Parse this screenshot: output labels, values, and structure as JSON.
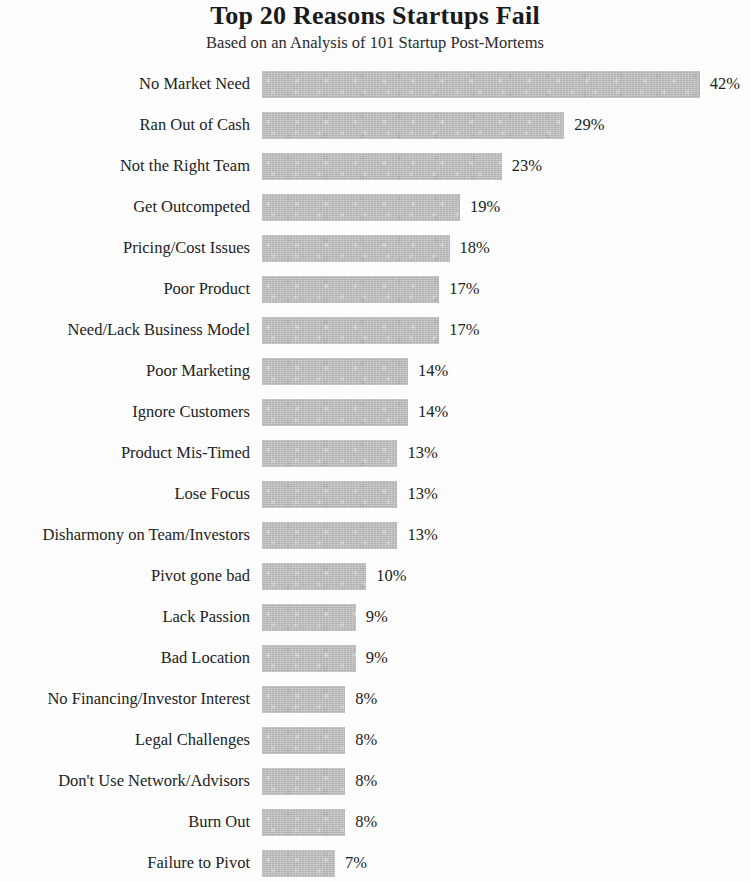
{
  "chart_data": {
    "type": "bar",
    "orientation": "horizontal",
    "title": "Top 20 Reasons Startups Fail",
    "subtitle": "Based on an Analysis of 101 Startup Post-Mortems",
    "xlabel": "",
    "ylabel": "",
    "xlim": [
      0,
      42
    ],
    "grid": false,
    "legend": null,
    "value_suffix": "%",
    "bar_color": "#bebebe",
    "text_color": "#222222",
    "background_color": "#fdfdfd",
    "categories": [
      "No Market Need",
      "Ran Out of Cash",
      "Not the Right Team",
      "Get Outcompeted",
      "Pricing/Cost Issues",
      "Poor Product",
      "Need/Lack Business Model",
      "Poor Marketing",
      "Ignore Customers",
      "Product Mis-Timed",
      "Lose Focus",
      "Disharmony on Team/Investors",
      "Pivot gone bad",
      "Lack Passion",
      "Bad Location",
      "No Financing/Investor Interest",
      "Legal Challenges",
      "Don't Use Network/Advisors",
      "Burn Out",
      "Failure to Pivot"
    ],
    "values": [
      42,
      29,
      23,
      19,
      18,
      17,
      17,
      14,
      14,
      13,
      13,
      13,
      10,
      9,
      9,
      8,
      8,
      8,
      8,
      7
    ],
    "value_labels": [
      "42%",
      "29%",
      "23%",
      "19%",
      "18%",
      "17%",
      "17%",
      "14%",
      "14%",
      "13%",
      "13%",
      "13%",
      "10%",
      "9%",
      "9%",
      "8%",
      "8%",
      "8%",
      "8%",
      "7%"
    ]
  }
}
